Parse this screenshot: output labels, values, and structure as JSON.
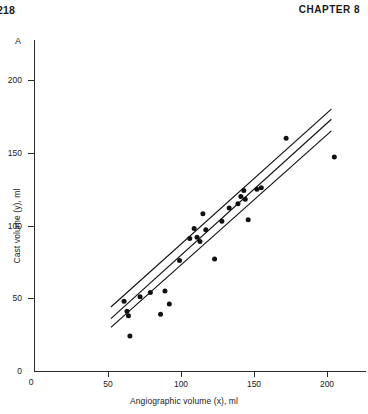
{
  "page": {
    "folio": "218",
    "chapter_label": "CHAPTER 8"
  },
  "figure": {
    "panel_label": "A"
  },
  "chart_data": {
    "type": "scatter",
    "title": "",
    "panel": "A",
    "xlabel": "Angiographic volume (x), ml",
    "ylabel": "Cast volume (y), ml",
    "xlim": [
      0,
      225
    ],
    "ylim": [
      0,
      213
    ],
    "xticks": [
      0,
      50,
      100,
      150,
      200
    ],
    "yticks": [
      0,
      50,
      100,
      150,
      200
    ],
    "xtick_labels": [
      "0",
      "50",
      "100",
      "150",
      "200"
    ],
    "ytick_labels": [
      "0",
      "50",
      "100",
      "150",
      "200"
    ],
    "grid": false,
    "legend": null,
    "marker": "filled-circle",
    "marker_color": "#111111",
    "line_color": "#111111",
    "points": [
      [
        61,
        48
      ],
      [
        63,
        41
      ],
      [
        64,
        38
      ],
      [
        65,
        24
      ],
      [
        72,
        51
      ],
      [
        79,
        54
      ],
      [
        86,
        39
      ],
      [
        89,
        55
      ],
      [
        92,
        46
      ],
      [
        99,
        76
      ],
      [
        106,
        91
      ],
      [
        109,
        98
      ],
      [
        111,
        92
      ],
      [
        113,
        89
      ],
      [
        115,
        108
      ],
      [
        117,
        97
      ],
      [
        123,
        77
      ],
      [
        128,
        103
      ],
      [
        133,
        112
      ],
      [
        139,
        115
      ],
      [
        141,
        120
      ],
      [
        143,
        124
      ],
      [
        144,
        118
      ],
      [
        146,
        104
      ],
      [
        152,
        125
      ],
      [
        155,
        126
      ],
      [
        172,
        160
      ],
      [
        205,
        147
      ]
    ],
    "fit_lines": [
      {
        "name": "regression-line",
        "x": [
          52,
          203
        ],
        "y": [
          36,
          173
        ]
      },
      {
        "name": "confidence-upper",
        "x": [
          52,
          203
        ],
        "y": [
          44,
          180
        ]
      },
      {
        "name": "confidence-lower",
        "x": [
          52,
          203
        ],
        "y": [
          30,
          165
        ]
      }
    ]
  }
}
